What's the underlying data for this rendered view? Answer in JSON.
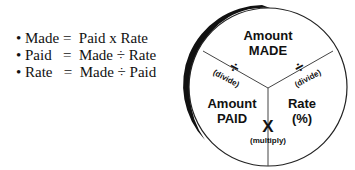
{
  "formulas": [
    "• Made =  Paid x Rate",
    "• Paid   =  Made ÷ Rate",
    "• Rate   =  Made ÷ Paid"
  ],
  "wheel": {
    "top": {
      "line1": "Amount",
      "line2": "MADE"
    },
    "left": {
      "line1": "Amount",
      "line2": "PAID"
    },
    "right": {
      "line1": "Rate",
      "line2": "(%)"
    },
    "divide_left": {
      "symbol": "÷",
      "label": "(divide)"
    },
    "divide_right": {
      "symbol": "÷",
      "label": "(divide)"
    },
    "multiply": {
      "symbol": "X",
      "label": "(multiply)"
    }
  }
}
